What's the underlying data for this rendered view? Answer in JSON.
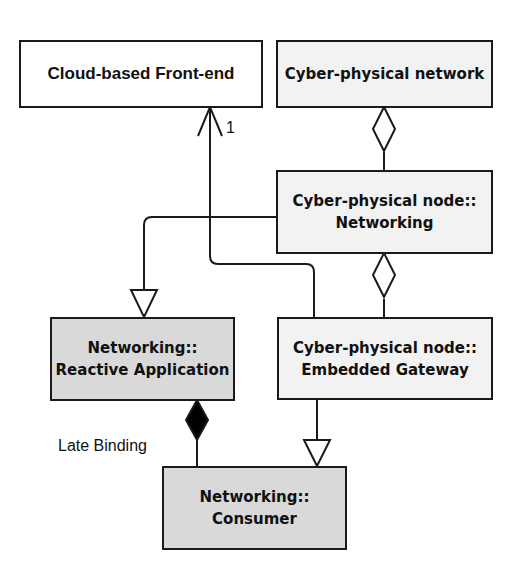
{
  "diagram": {
    "nodes": [
      {
        "id": "cloud",
        "lines": [
          "Cloud-based Front-end"
        ],
        "fill": "#ffffff"
      },
      {
        "id": "cpnet",
        "lines": [
          "Cyber-physical network"
        ],
        "fill": "#f2f2f2"
      },
      {
        "id": "cpnode_net",
        "lines": [
          "Cyber-physical node::",
          "Networking"
        ],
        "fill": "#f2f2f2"
      },
      {
        "id": "net_reactive",
        "lines": [
          "Networking::",
          "Reactive Application"
        ],
        "fill": "#d9d9d9"
      },
      {
        "id": "cpnode_gw",
        "lines": [
          "Cyber-physical node::",
          "Embedded Gateway"
        ],
        "fill": "#f2f2f2"
      },
      {
        "id": "net_consumer",
        "lines": [
          "Networking::",
          "Consumer"
        ],
        "fill": "#d9d9d9"
      }
    ],
    "edges": [
      {
        "from": "cpnode_net",
        "to": "cpnet",
        "type": "aggregation"
      },
      {
        "from": "cpnode_gw",
        "to": "cpnode_net",
        "type": "aggregation"
      },
      {
        "from": "cpnode_gw",
        "to": "cloud",
        "type": "association",
        "multiplicity": "1"
      },
      {
        "from": "cpnode_net",
        "to": "net_reactive",
        "type": "generalization"
      },
      {
        "from": "cpnode_gw",
        "to": "net_consumer",
        "type": "generalization"
      },
      {
        "from": "net_consumer",
        "to": "net_reactive",
        "type": "composition",
        "label": "Late Binding"
      }
    ],
    "labels": {
      "multiplicity": "1",
      "late_binding": "Late Binding"
    }
  }
}
